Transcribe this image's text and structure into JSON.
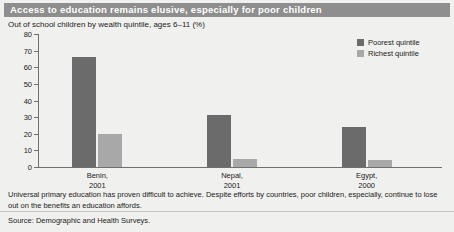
{
  "header": {
    "title": "Access to education remains elusive, especially for poor children",
    "banner_color": "#8e8e8e",
    "title_color": "#ffffff"
  },
  "subtitle": "Out of school children by wealth quintile, ages 6–11 (%)",
  "caption": "Universal primary education has proven difficult to achieve. Despite efforts by countries, poor children, especially, continue to lose out on the benefits an education affords.",
  "source": "Source: Demographic and Health Surveys.",
  "chart_data": {
    "type": "bar",
    "title": "Access to education remains elusive, especially for poor children",
    "subtitle": "Out of school children by wealth quintile, ages 6–11 (%)",
    "categories": [
      "Benin,\n2001",
      "Nepal,\n2001",
      "Egypt,\n2000"
    ],
    "category_lines": [
      [
        "Benin,",
        "2001"
      ],
      [
        "Nepal,",
        "2001"
      ],
      [
        "Egypt,",
        "2000"
      ]
    ],
    "series": [
      {
        "name": "Poorest quintile",
        "color": "#6b6b6b",
        "values": [
          66,
          31,
          24
        ]
      },
      {
        "name": "Richest quintile",
        "color": "#a8a8a8",
        "values": [
          20,
          5,
          4
        ]
      }
    ],
    "xlabel": "",
    "ylabel": "",
    "ylim": [
      0,
      80
    ],
    "yticks": [
      0,
      10,
      20,
      30,
      40,
      50,
      60,
      70,
      80
    ],
    "ytick_labels": [
      "0",
      "10",
      "20",
      "30",
      "40",
      "50",
      "60",
      "70",
      "80"
    ],
    "grid": false,
    "legend_position": "top-right"
  },
  "legend": [
    {
      "label": "Poorest quintile",
      "color": "#6b6b6b"
    },
    {
      "label": "Richest quintile",
      "color": "#a8a8a8"
    }
  ]
}
